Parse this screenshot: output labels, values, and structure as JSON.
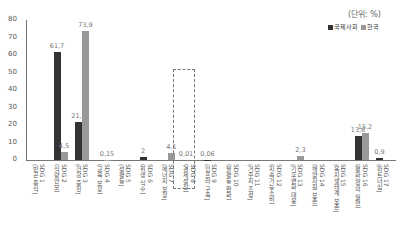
{
  "unit_label": "(단위: %)",
  "legend": [
    {
      "label": "국제사회",
      "color": "#333333"
    },
    {
      "label": "한국",
      "color": "#999999"
    }
  ],
  "colors": {
    "international": "#333333",
    "korea": "#999999"
  },
  "chart_data": {
    "type": "bar",
    "title": "",
    "xlabel": "",
    "ylabel": "",
    "unit": "%",
    "ylim": [
      0,
      80
    ],
    "yticks": [
      0,
      10,
      20,
      30,
      40,
      50,
      60,
      70,
      80
    ],
    "grid": false,
    "legend_position": "top-right",
    "categories": [
      "SDG 1 (빈곤 종식)",
      "SDG 2 (식량안보)",
      "SDG 3 (건강 증진)",
      "SDG 4 (교육 보장)",
      "SDG 5 (성평등)",
      "SDG 6 (위생 식수)",
      "SDG 7 (에너지 보장)",
      "SDG 8 (경제성장)",
      "SDG 9 (인프라 구축)",
      "SDG 10 (불평등 완화)",
      "SDG 11 (거주지 조성)",
      "SDG 12 (지속가능소비)",
      "SDG 13 (기후변화 대응)",
      "SDG 14 (해양자원 보존)",
      "SDG 15 (육지생태계 보존)",
      "SDG 16 (평화/정의 실현)",
      "SDG 17 (파트너십)"
    ],
    "series": [
      {
        "name": "국제사회",
        "values": [
          0,
          61.7,
          21.5,
          0,
          0,
          2,
          0,
          0.01,
          0.06,
          0,
          0,
          0,
          0,
          0,
          0,
          13.6,
          0.9
        ]
      },
      {
        "name": "한국",
        "values": [
          0,
          4.5,
          73.9,
          0.15,
          0,
          0,
          4.1,
          0,
          0,
          0,
          0,
          0,
          2.3,
          0,
          0,
          15.2,
          0
        ]
      }
    ],
    "annotations": [
      {
        "category": "SDG 2 (식량안보)",
        "series": "국제사회",
        "text": "61,7"
      },
      {
        "category": "SDG 2 (식량안보)",
        "series": "한국",
        "text": "4,5"
      },
      {
        "category": "SDG 3 (건강 증진)",
        "series": "국제사회",
        "text": "21,5"
      },
      {
        "category": "SDG 3 (건강 증진)",
        "series": "한국",
        "text": "73,9"
      },
      {
        "category": "SDG 4 (교육 보장)",
        "series": "한국",
        "text": "0,15"
      },
      {
        "category": "SDG 6 (위생 식수)",
        "series": "국제사회",
        "text": "2"
      },
      {
        "category": "SDG 7 (에너지 보장)",
        "series": "한국",
        "text": "4,1"
      },
      {
        "category": "SDG 8 (경제성장)",
        "series": "국제사회",
        "text": "0,01"
      },
      {
        "category": "SDG 9 (인프라 구축)",
        "series": "국제사회",
        "text": "0,06"
      },
      {
        "category": "SDG 13 (기후변화 대응)",
        "series": "한국",
        "text": "2,3"
      },
      {
        "category": "SDG 16 (평화/정의 실현)",
        "series": "국제사회",
        "text": "13,6"
      },
      {
        "category": "SDG 16 (평화/정의 실현)",
        "series": "한국",
        "text": "15,2"
      },
      {
        "category": "SDG 17 (파트너십)",
        "series": "국제사회",
        "text": "0,9"
      }
    ],
    "highlight": "SDG 8 (경제성장)"
  }
}
